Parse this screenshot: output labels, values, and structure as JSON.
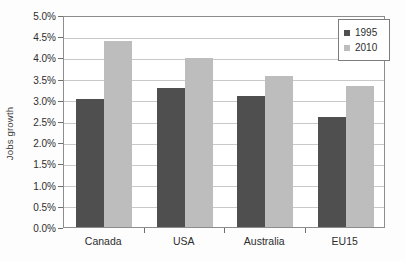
{
  "chart_data": {
    "type": "bar",
    "title": "",
    "xlabel": "",
    "ylabel": "Jobs growth",
    "categories": [
      "Canada",
      "USA",
      "Australia",
      "EU15"
    ],
    "series": [
      {
        "name": "1995",
        "color": "#4f4f4f",
        "values": [
          3.02,
          3.29,
          3.1,
          2.6
        ]
      },
      {
        "name": "2010",
        "color": "#bdbdbd",
        "values": [
          4.39,
          3.99,
          3.55,
          3.32
        ]
      }
    ],
    "ylim": [
      0.0,
      5.0
    ],
    "ytick_step": 0.5,
    "ytick_labels": [
      "0.0%",
      "0.5%",
      "1.0%",
      "1.5%",
      "2.0%",
      "2.5%",
      "3.0%",
      "3.5%",
      "4.0%",
      "4.5%",
      "5.0%"
    ],
    "ytick_values": [
      0.0,
      0.5,
      1.0,
      1.5,
      2.0,
      2.5,
      3.0,
      3.5,
      4.0,
      4.5,
      5.0
    ],
    "grid": true,
    "legend_position": "top-right",
    "value_format": "percent"
  },
  "legend": {
    "entries": [
      {
        "label": "1995",
        "swatch": "#4f4f4f"
      },
      {
        "label": "2010",
        "swatch": "#bdbdbd"
      }
    ]
  }
}
